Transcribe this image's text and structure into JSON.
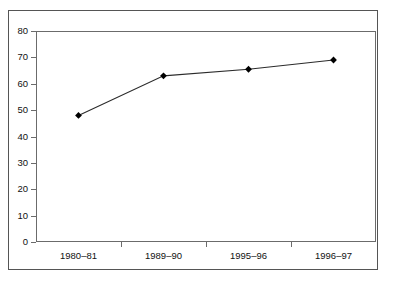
{
  "chart_data": {
    "type": "line",
    "title": "",
    "subtitle": "",
    "xlabel": "",
    "ylabel": "",
    "categories": [
      "1980–81",
      "1989–90",
      "1995–96",
      "1996–97"
    ],
    "series": [
      {
        "name": "",
        "values": [
          48,
          63,
          65.5,
          69
        ]
      }
    ],
    "ylim": [
      0,
      80
    ],
    "ytick_step": 10,
    "yticks": [
      0,
      10,
      20,
      30,
      40,
      50,
      60,
      70,
      80
    ],
    "ytick_labels": [
      "0",
      "10",
      "20",
      "30",
      "40",
      "50",
      "60",
      "70",
      "80"
    ],
    "grid": false,
    "legend": false,
    "legend_position": "none",
    "marker": "diamond",
    "annotations": []
  },
  "style": {
    "line_color": "#2b2b2b",
    "marker_color": "#000000",
    "axis_color": "#6b6b6b",
    "frame_color": "#555555",
    "background": "#ffffff",
    "text_color": "#111111"
  }
}
